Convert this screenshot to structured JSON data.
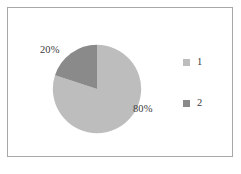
{
  "chart_data": {
    "type": "pie",
    "title": "",
    "categories": [
      "1",
      "2"
    ],
    "values": [
      80,
      20
    ],
    "labels": [
      "80%",
      "20%"
    ],
    "colors": [
      "#bdbdbd",
      "#8a8a8a"
    ],
    "legend_position": "right",
    "grid": false,
    "start_angle": 0,
    "direction": "clockwise",
    "slices": [
      {
        "name": "1",
        "value": 80,
        "label": "80%",
        "color": "#bdbdbd"
      },
      {
        "name": "2",
        "value": 20,
        "label": "20%",
        "color": "#8a8a8a"
      }
    ]
  },
  "figure": {
    "frame_border_color": "#a8a8a8",
    "background": "#ffffff"
  },
  "legend": {
    "entries": [
      {
        "label": "1",
        "color": "#bdbdbd"
      },
      {
        "label": "2",
        "color": "#8a8a8a"
      }
    ]
  },
  "caption": {
    "text": ""
  }
}
